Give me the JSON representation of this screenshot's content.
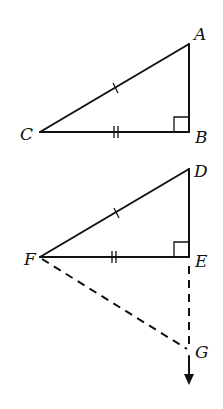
{
  "diagram": {
    "triangle_top": {
      "vertices": [
        "A",
        "B",
        "C"
      ],
      "right_angle_at": "B",
      "tick_marks": {
        "hypotenuse_CA": 1,
        "leg_CB": 2
      }
    },
    "triangle_bottom": {
      "vertices": [
        "D",
        "E",
        "F"
      ],
      "right_angle_at": "E",
      "tick_marks": {
        "hypotenuse_FD": 1,
        "leg_FE": 2
      }
    },
    "construction": {
      "dashed_segments": [
        "FG",
        "EG"
      ],
      "ray_from": "E",
      "ray_direction": "down",
      "point": "G"
    },
    "labels": {
      "A": "A",
      "B": "B",
      "C": "C",
      "D": "D",
      "E": "E",
      "F": "F",
      "G": "G"
    }
  }
}
